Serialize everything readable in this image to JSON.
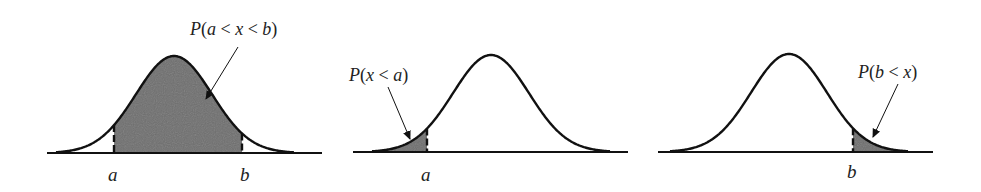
{
  "figure": {
    "panels": [
      {
        "id": "between",
        "caption_parts": [
          {
            "t": "P",
            "it": true
          },
          {
            "t": "(",
            "it": false
          },
          {
            "t": "a",
            "it": true
          },
          {
            "t": " < ",
            "it": false
          },
          {
            "t": "x",
            "it": true
          },
          {
            "t": " < ",
            "it": false
          },
          {
            "t": "b",
            "it": true
          },
          {
            "t": ")",
            "it": false
          }
        ],
        "caption": "P(a < x < b)",
        "labels": [
          "a",
          "b"
        ],
        "shaded_region": "between a and b"
      },
      {
        "id": "left-tail",
        "caption": "P(x < a)",
        "labels": [
          "a"
        ],
        "shaded_region": "left of a"
      },
      {
        "id": "right-tail",
        "caption": "P(b < x)",
        "labels": [
          "b"
        ],
        "shaded_region": "right of b"
      }
    ],
    "colors": {
      "curve": "#111111",
      "shade": "#6e6e6e",
      "background": "#ffffff",
      "text": "#222222"
    }
  },
  "labels": {
    "p1_a": "a",
    "p1_b": "b",
    "p2_a": "a",
    "p3_b": "b",
    "p1_caption": "P(a < x < b)",
    "p2_caption": "P(x < a)",
    "p3_caption": "P(b < x)"
  }
}
